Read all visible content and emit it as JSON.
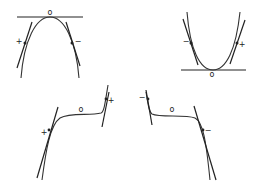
{
  "diagram": {
    "panels": [
      {
        "id": "concave-down",
        "labels": {
          "top": "o",
          "left": "+",
          "right": "−"
        }
      },
      {
        "id": "concave-up",
        "labels": {
          "bottom": "o",
          "left": "−",
          "right": "+"
        }
      },
      {
        "id": "increasing-cubic",
        "labels": {
          "middle": "o",
          "left": "+",
          "right": "+"
        }
      },
      {
        "id": "decreasing-cubic",
        "labels": {
          "middle": "o",
          "left": "−",
          "right": "−"
        }
      }
    ]
  },
  "colors": {
    "stroke": "#222222",
    "background": "#ffffff"
  }
}
